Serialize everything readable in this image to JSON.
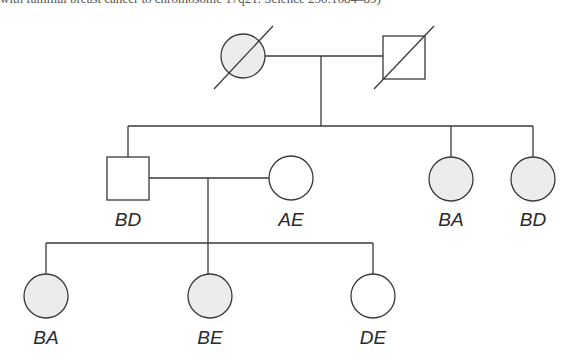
{
  "caption": "with familial breast cancer to chromosome 17q21. Science 250:1684–89)",
  "colors": {
    "stroke": "#3a3a3a",
    "affected_fill": "#ececec",
    "unaffected_fill": "#ffffff"
  },
  "pedigree": {
    "generation_1": [
      {
        "id": "I-1",
        "sex": "female",
        "affected": true,
        "deceased": true,
        "label": ""
      },
      {
        "id": "I-2",
        "sex": "male",
        "affected": false,
        "deceased": true,
        "label": ""
      }
    ],
    "generation_2": [
      {
        "id": "II-1",
        "sex": "male",
        "affected": false,
        "deceased": false,
        "label": "BD"
      },
      {
        "id": "II-spouse",
        "sex": "female",
        "affected": false,
        "deceased": false,
        "label": "AE"
      },
      {
        "id": "II-2",
        "sex": "female",
        "affected": true,
        "deceased": false,
        "label": "BA"
      },
      {
        "id": "II-3",
        "sex": "female",
        "affected": true,
        "deceased": false,
        "label": "BD"
      }
    ],
    "generation_3": [
      {
        "id": "III-1",
        "sex": "female",
        "affected": true,
        "deceased": false,
        "label": "BA"
      },
      {
        "id": "III-2",
        "sex": "female",
        "affected": true,
        "deceased": false,
        "label": "BE"
      },
      {
        "id": "III-3",
        "sex": "female",
        "affected": false,
        "deceased": false,
        "label": "DE"
      }
    ]
  }
}
